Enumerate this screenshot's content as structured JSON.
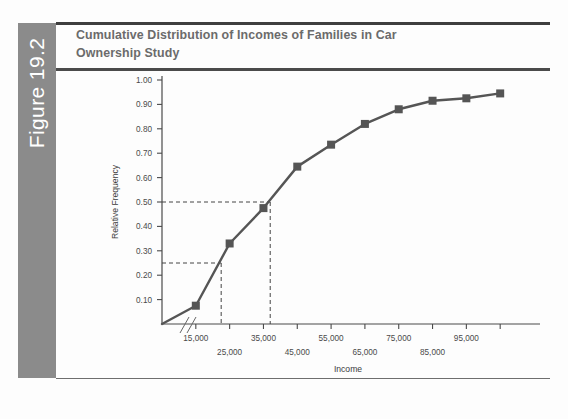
{
  "figure": {
    "tab_label": "Figure 19.2",
    "title": "Cumulative Distribution of Incomes of Families in Car Ownership Study"
  },
  "colors": {
    "tab_background": "#8b8b8b",
    "tab_text": "#ffffff",
    "title_text": "#6b6b6b",
    "rule": "#3e3e3e",
    "series_line": "#555555",
    "marker": "#555555",
    "reference_dash": "#444444",
    "axis": "#4a4a4a",
    "page_background": "#fdfdfd"
  },
  "chart_data": {
    "type": "line",
    "title": "Cumulative Distribution of Incomes of Families in Car Ownership Study",
    "xlabel": "Income",
    "ylabel": "Relative Frequency",
    "grid": false,
    "legend": "none",
    "xlim": [
      5000,
      115000
    ],
    "ylim": [
      0.0,
      1.0
    ],
    "axis_break": true,
    "x_tick_values": [
      15000,
      25000,
      35000,
      45000,
      55000,
      65000,
      75000,
      85000,
      95000,
      105000
    ],
    "x_tick_labels_upper": [
      "15,000",
      "35,000",
      "55,000",
      "75,000",
      "95,000"
    ],
    "x_tick_labels_lower": [
      "25,000",
      "45,000",
      "65,000",
      "85,000"
    ],
    "y_tick_values": [
      0.1,
      0.2,
      0.3,
      0.4,
      0.5,
      0.6,
      0.7,
      0.8,
      0.9,
      1.0
    ],
    "y_tick_labels": [
      "0.10",
      "0.20",
      "0.30",
      "0.40",
      "0.50",
      "0.60",
      "0.70",
      "0.80",
      "0.90",
      "1.00"
    ],
    "series": [
      {
        "name": "Cumulative relative frequency",
        "x": [
          5000,
          15000,
          25000,
          35000,
          45000,
          55000,
          65000,
          75000,
          85000,
          95000,
          105000
        ],
        "values": [
          0.0,
          0.075,
          0.33,
          0.475,
          0.645,
          0.735,
          0.82,
          0.88,
          0.915,
          0.925,
          0.945
        ],
        "marker": "square"
      }
    ],
    "reference_lines": [
      {
        "name": "median",
        "y": 0.5,
        "x": 37000,
        "style": "dashed",
        "label": "0.50"
      },
      {
        "name": "first-quartile",
        "y": 0.25,
        "x": 22500,
        "style": "dashed",
        "label": "0.25"
      }
    ]
  }
}
